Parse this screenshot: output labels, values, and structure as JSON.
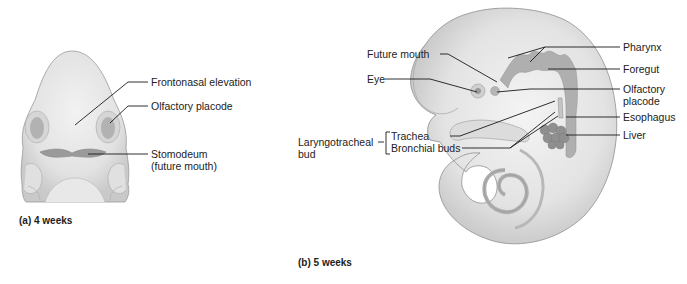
{
  "figure_a": {
    "caption": "(a)  4 weeks",
    "labels": {
      "frontonasal": "Frontonasal elevation",
      "olfactory": "Olfactory placode",
      "stomodeum_1": "Stomodeum",
      "stomodeum_2": "(future mouth)"
    }
  },
  "figure_b": {
    "caption": "(b)  5 weeks",
    "labels": {
      "future_mouth": "Future mouth",
      "eye": "Eye",
      "laryngotracheal_1": "Laryngotracheal",
      "laryngotracheal_2": "bud",
      "trachea": "Trachea",
      "bronchial_buds": "Bronchial buds",
      "pharynx": "Pharynx",
      "foregut": "Foregut",
      "olfactory_1": "Olfactory",
      "olfactory_2": "placode",
      "esophagus": "Esophagus",
      "liver": "Liver"
    }
  },
  "colors": {
    "embryo_fill": "#e4e4e4",
    "embryo_shadow": "#c8c8c8",
    "gut_fill": "#a9a9a9",
    "leader_line": "#1a1a1a"
  }
}
